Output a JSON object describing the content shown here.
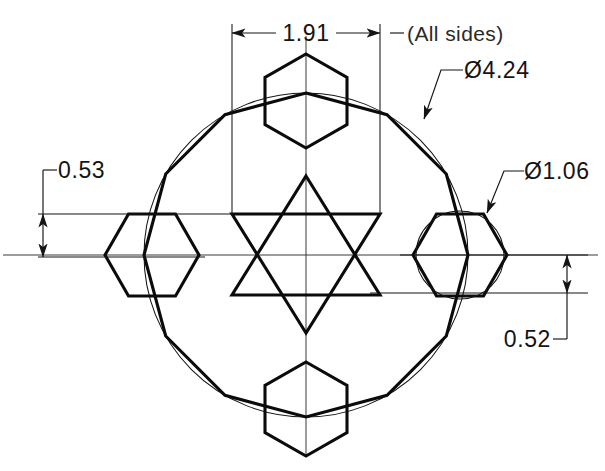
{
  "drawing": {
    "title": "Hex-lobed rotor geometry — dimensioned orthographic view",
    "background_color": "#ffffff",
    "line_color": "#0b0b0b",
    "thin_line_color": "#141414",
    "center_line_color": "#3a3a3a",
    "units_note": "inches (implied)"
  },
  "dimensions": [
    {
      "id": "width-1-91",
      "label": "1.91",
      "type": "linear-horizontal",
      "value": 1.91,
      "text_x": 306,
      "text_y": 41,
      "dim_line_y": 33,
      "from_x": 232,
      "to_x": 380
    },
    {
      "id": "bolt-circle-4-24",
      "label": "Ø4.24",
      "type": "diameter",
      "value": 4.24,
      "symbol": "diameter-symbol",
      "text_x": 480,
      "text_y": 76
    },
    {
      "id": "lobe-circle-1-06",
      "label": "Ø1.06",
      "type": "diameter",
      "value": 1.06,
      "symbol": "diameter-symbol",
      "text_x": 500,
      "text_y": 177
    },
    {
      "id": "offset-0-53",
      "label": "0.53",
      "type": "linear-vertical",
      "value": 0.53,
      "text_x": 68,
      "text_y": 183,
      "dim_line_x": 43,
      "from_y": 214,
      "to_y": 257
    },
    {
      "id": "offset-0-52",
      "label": "0.52",
      "type": "linear-vertical",
      "value": 0.52,
      "text_x": 481,
      "text_y": 346,
      "dim_line_x": 567,
      "from_y": 255,
      "to_y": 293
    }
  ],
  "notes": [
    {
      "id": "all-sides-note",
      "label": "(All  sides)",
      "text_x": 424,
      "text_y": 41
    }
  ],
  "geometry": {
    "center": {
      "x": 306,
      "y": 255
    },
    "outer_circle": {
      "cx": 306,
      "cy": 255,
      "r": 162,
      "name": "pitch-circle-4-24"
    },
    "outer_polygon": {
      "name": "dodecagon-body",
      "sides": 12,
      "circumradius": 162,
      "start_angle_deg": 15
    },
    "star": {
      "name": "star-of-david",
      "up_triangle": [
        [
          306,
          176
        ],
        [
          380,
          295
        ],
        [
          232,
          295
        ]
      ],
      "down_triangle": [
        [
          306,
          333
        ],
        [
          232,
          214
        ],
        [
          380,
          214
        ]
      ]
    },
    "hexagons": [
      {
        "id": "hex-top",
        "cx": 306,
        "cy": 101,
        "r": 47,
        "orientation": "pointy-vertical"
      },
      {
        "id": "hex-bottom",
        "cx": 306,
        "cy": 409,
        "r": 47,
        "orientation": "pointy-vertical"
      },
      {
        "id": "hex-left",
        "cx": 152,
        "cy": 255,
        "r": 47,
        "orientation": "pointy-horizontal"
      },
      {
        "id": "hex-right",
        "cx": 460,
        "cy": 255,
        "r": 47,
        "orientation": "pointy-horizontal"
      }
    ],
    "lobe_circle": {
      "cx": 460,
      "cy": 255,
      "r": 43,
      "name": "lobe-circle-1-06"
    }
  }
}
